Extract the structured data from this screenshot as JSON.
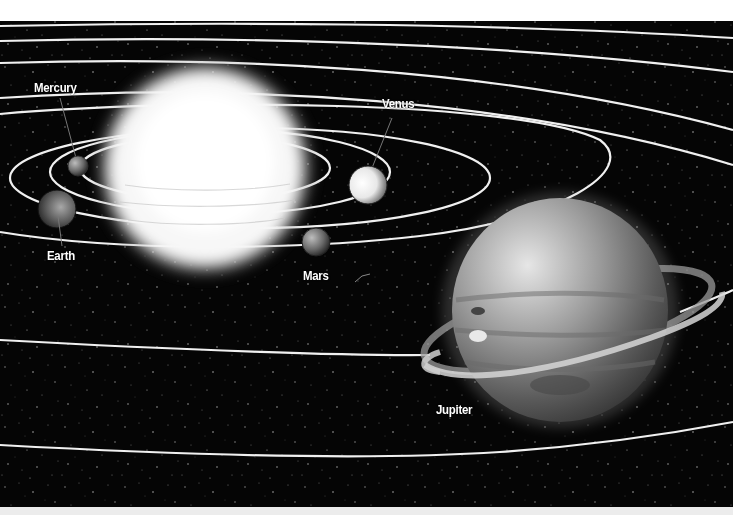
{
  "diagram": {
    "colors": {
      "space": "#050505",
      "orbit": "#f2f2f2",
      "top_margin": "#ffffff",
      "bottom_margin": "#eeeeee",
      "label": "#ffffff"
    },
    "sun": {
      "cx": 205,
      "cy": 168,
      "r": 96
    },
    "planets": [
      {
        "name": "Mercury",
        "label": "Mercury",
        "cx": 78,
        "cy": 166,
        "r": 10,
        "label_x": 33,
        "label_y": 80
      },
      {
        "name": "Venus",
        "label": "Venus",
        "cx": 368,
        "cy": 185,
        "r": 18,
        "label_x": 381,
        "label_y": 96
      },
      {
        "name": "Earth",
        "label": "Earth",
        "cx": 57,
        "cy": 209,
        "r": 19,
        "label_x": 46,
        "label_y": 248
      },
      {
        "name": "Mars",
        "label": "Mars",
        "cx": 316,
        "cy": 242,
        "r": 14,
        "label_x": 302,
        "label_y": 268
      },
      {
        "name": "Jupiter",
        "label": "Jupiter",
        "cx": 560,
        "cy": 310,
        "r": 110,
        "label_x": 435,
        "label_y": 402
      }
    ]
  }
}
